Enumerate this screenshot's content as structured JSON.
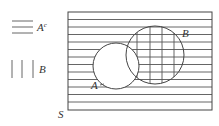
{
  "legend": {
    "items": [
      {
        "pattern": "horizontal-lines",
        "label": "A",
        "superscript": "c"
      },
      {
        "pattern": "vertical-lines",
        "label": "B"
      }
    ]
  },
  "venn": {
    "universe_label": "S",
    "sets": [
      {
        "name": "A",
        "label": "A",
        "cx": 116,
        "cy": 66,
        "r": 23
      },
      {
        "name": "B",
        "label": "B",
        "cx": 155,
        "cy": 55,
        "r": 29
      }
    ],
    "shading": {
      "horizontal": "A complement",
      "vertical": "B minus A"
    }
  },
  "colors": {
    "line": "#555555",
    "background": "#ffffff"
  }
}
